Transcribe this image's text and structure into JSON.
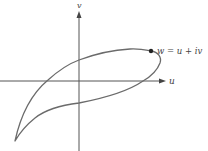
{
  "diagram": {
    "axes": {
      "horizontal_label": "u",
      "vertical_label": "v"
    },
    "point": {
      "label": "w = u + iv"
    },
    "colors": {
      "curve": "#6b6b6b",
      "axes": "#555555",
      "point": "#222222",
      "background": "#ffffff"
    }
  }
}
